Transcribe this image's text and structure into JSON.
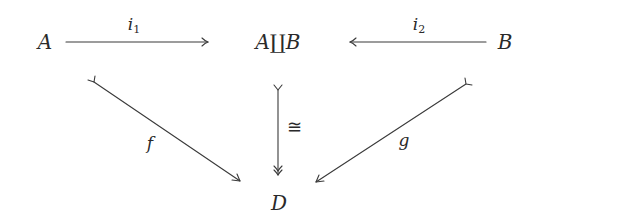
{
  "diagram": {
    "type": "commutative-diagram",
    "stroke_color": "#3a3a3a",
    "text_color": "#2a2a2a",
    "objects": [
      {
        "id": "A",
        "label": "A",
        "x": 45,
        "y": 42
      },
      {
        "id": "AB",
        "label": "A∐B",
        "x": 278,
        "y": 42
      },
      {
        "id": "B",
        "label": "B",
        "x": 505,
        "y": 42
      },
      {
        "id": "D",
        "label": "D",
        "x": 279,
        "y": 203
      }
    ],
    "morphisms": [
      {
        "id": "i1",
        "label_base": "i",
        "label_sub": "1",
        "from": "A",
        "to": "AB",
        "style": "arrow",
        "label_x": 133,
        "label_y": 24
      },
      {
        "id": "i2",
        "label_base": "i",
        "label_sub": "2",
        "from": "B",
        "to": "AB",
        "style": "arrow",
        "label_x": 418,
        "label_y": 24
      },
      {
        "id": "f",
        "label": "f",
        "from": "A",
        "to": "D",
        "style": "mono (tail) arrow",
        "label_x": 150,
        "label_y": 143
      },
      {
        "id": "g",
        "label": "g",
        "from": "B",
        "to": "D",
        "style": "mono (tail) arrow",
        "label_x": 404,
        "label_y": 140
      },
      {
        "id": "iso",
        "label": "≅",
        "from": "AB",
        "to": "D",
        "style": "mono tail + epi (double head)",
        "label_x": 294,
        "label_y": 127
      }
    ]
  }
}
